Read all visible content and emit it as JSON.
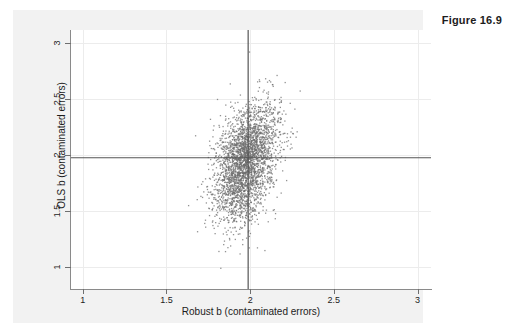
{
  "figure": {
    "caption": "Figure 16.9"
  },
  "chart_data": {
    "type": "scatter",
    "title": "",
    "xlabel": "Robust b (contaminated errors)",
    "ylabel": "OLS b (contaminated errors)",
    "xlim": [
      0.93,
      3.08
    ],
    "ylim": [
      0.8,
      3.12
    ],
    "xticks": [
      1,
      1.5,
      2,
      2.5,
      3
    ],
    "xticklabels": [
      "1",
      "1.5",
      "2",
      "2.5",
      "3"
    ],
    "yticks": [
      1,
      1.5,
      2,
      2.5,
      3
    ],
    "yticklabels": [
      "1",
      "1.5",
      "2",
      "2.5",
      "3"
    ],
    "grid": true,
    "grid_color": "#ececec",
    "legend": null,
    "marker": {
      "shape": "dot",
      "size_px": 1.3,
      "color": "#6e6e6e",
      "opacity": 0.75
    },
    "reference_lines": [
      {
        "orientation": "horizontal",
        "value": 1.98,
        "color": "#555555",
        "width_px": 1.2,
        "label": "true b = 2 (OLS)"
      },
      {
        "orientation": "vertical",
        "value": 1.985,
        "color": "#555555",
        "width_px": 1.2,
        "label": "true b = 2 (Robust)"
      }
    ],
    "n_points": 3000,
    "distribution": {
      "kind": "bivariate-normal-mixture",
      "center_x": 1.972,
      "center_y": 1.955,
      "sd_x": 0.092,
      "sd_y": 0.235,
      "correlation": 0.38,
      "lower_tail_extra_sd_y": 0.17,
      "seed": 20250416
    }
  }
}
